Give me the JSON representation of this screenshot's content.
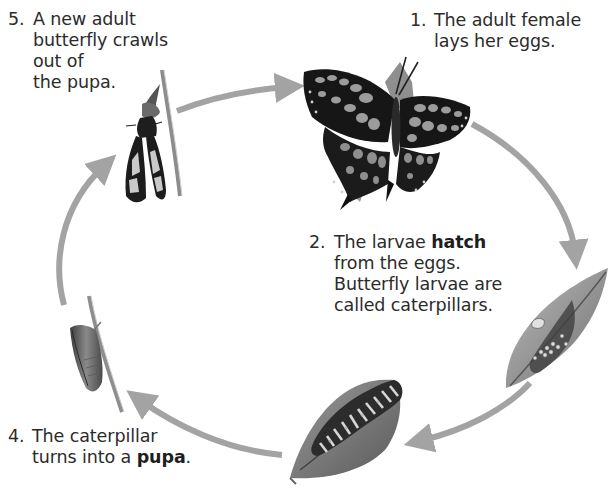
{
  "diagram": {
    "type": "life-cycle",
    "subject": "butterfly",
    "arrow_color": "#a3a3a3",
    "steps": [
      {
        "number": "1.",
        "lines": [
          "The adult female",
          "lays her eggs."
        ],
        "illustration": "adult-butterfly-icon"
      },
      {
        "number": "2.",
        "line1_plain": "The larvae ",
        "line1_bold": "hatch",
        "lines_rest": [
          "from the eggs.",
          "Butterfly larvae are",
          "called caterpillars."
        ],
        "illustration": "eggs-on-leaf-icon"
      },
      {
        "number": "3.",
        "illustration": "caterpillar-on-leaf-icon"
      },
      {
        "number": "4.",
        "line1": "The caterpillar",
        "line2_plain": "turns into a ",
        "line2_bold": "pupa",
        "line2_end": ".",
        "illustration": "pupa-on-stem-icon"
      },
      {
        "number": "5.",
        "lines": [
          "A new adult",
          "butterfly crawls",
          "out of",
          "the pupa."
        ],
        "illustration": "emerging-butterfly-icon"
      }
    ]
  }
}
